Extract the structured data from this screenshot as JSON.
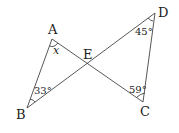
{
  "diagram": {
    "points": {
      "A": {
        "label": "A",
        "x": 52,
        "y": 39
      },
      "B": {
        "label": "B",
        "x": 27,
        "y": 108
      },
      "C": {
        "label": "C",
        "x": 143,
        "y": 102
      },
      "D": {
        "label": "D",
        "x": 155,
        "y": 13
      },
      "E": {
        "label": "E",
        "x": 87,
        "y": 64
      }
    },
    "segments": [
      "AB",
      "AC",
      "BD",
      "DC"
    ],
    "angles": {
      "A": "x",
      "B": "33°",
      "C": "59°",
      "D": "45°"
    },
    "intersection_label": "E"
  }
}
